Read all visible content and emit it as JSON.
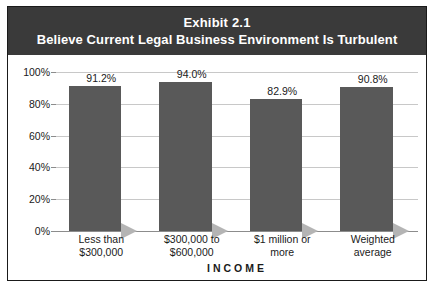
{
  "exhibit": {
    "title_line1": "Exhibit 2.1",
    "title_line2": "Believe Current Legal Business Environment Is Turbulent",
    "banner_color": "#3a3a3a",
    "bar_color": "#595959",
    "shadow_color": "#b4b4b4"
  },
  "chart_data": {
    "type": "bar",
    "title": "Believe Current Legal Business Environment Is Turbulent",
    "subtitle": "Exhibit 2.1",
    "categories": [
      "Less than $300,000",
      "$300,000 to $600,000",
      "$1 million or more",
      "Weighted average"
    ],
    "category_lines": [
      [
        "Less than",
        "$300,000"
      ],
      [
        "$300,000 to",
        "$600,000"
      ],
      [
        "$1 million or",
        "more"
      ],
      [
        "Weighted",
        "average"
      ]
    ],
    "values": [
      91.2,
      94.0,
      82.9,
      90.8
    ],
    "data_labels": [
      "91.2%",
      "94.0%",
      "82.9%",
      "90.8%"
    ],
    "xlabel": "INCOME",
    "ylabel": "",
    "ylim": [
      0,
      100
    ],
    "yticks": [
      0,
      20,
      40,
      60,
      80,
      100
    ],
    "ytick_labels": [
      "0%",
      "20%",
      "40%",
      "60%",
      "80%",
      "100%"
    ],
    "grid": true,
    "legend": null
  }
}
